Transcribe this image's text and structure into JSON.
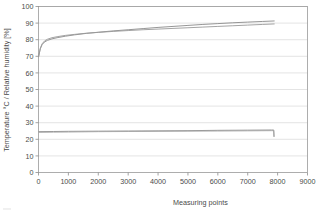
{
  "chart_data": {
    "type": "line",
    "title": "",
    "xlabel": "Measuring points",
    "ylabel": "Temperature °C / Relative humidity [%]",
    "xlim": [
      0,
      9000
    ],
    "ylim": [
      0,
      100
    ],
    "xticks": [
      0,
      1000,
      2000,
      3000,
      4000,
      5000,
      6000,
      7000,
      8000,
      9000
    ],
    "yticks": [
      0,
      10,
      20,
      30,
      40,
      50,
      60,
      70,
      80,
      90,
      100
    ],
    "xtick_labels": [
      "0",
      "1000",
      "2000",
      "3000",
      "4000",
      "5000",
      "6000",
      "7000",
      "8000",
      "9000"
    ],
    "ytick_labels": [
      "0",
      "10",
      "20",
      "30",
      "40",
      "50",
      "60",
      "70",
      "80",
      "90",
      "100"
    ],
    "grid": true,
    "grid_axis": "y",
    "legend": "none",
    "series": [
      {
        "name": "Relative humidity sensor 1",
        "unit": "%",
        "color": "#8a8a8a",
        "x": [
          0,
          60,
          120,
          200,
          300,
          450,
          650,
          900,
          1200,
          1600,
          2000,
          2500,
          3000,
          3500,
          4000,
          4500,
          5000,
          5500,
          6000,
          6500,
          7000,
          7500,
          7900
        ],
        "values": [
          69.5,
          74.5,
          77.0,
          78.6,
          79.6,
          80.5,
          81.3,
          82.1,
          82.9,
          83.8,
          84.5,
          85.3,
          86.0,
          86.7,
          87.4,
          88.0,
          88.6,
          89.2,
          89.7,
          90.2,
          90.6,
          91.0,
          91.3
        ]
      },
      {
        "name": "Relative humidity sensor 2",
        "unit": "%",
        "color": "#9a9a9a",
        "x": [
          0,
          60,
          120,
          200,
          300,
          450,
          650,
          900,
          1200,
          1600,
          2000,
          2500,
          3000,
          3500,
          4000,
          4500,
          5000,
          5500,
          6000,
          6500,
          7000,
          7500,
          7900
        ],
        "values": [
          69.5,
          74.8,
          77.5,
          79.2,
          80.3,
          81.2,
          81.9,
          82.6,
          83.2,
          83.9,
          84.4,
          85.0,
          85.5,
          86.0,
          86.4,
          86.8,
          87.2,
          87.6,
          88.0,
          88.4,
          88.8,
          89.2,
          89.5
        ]
      },
      {
        "name": "Temperature sensor 1",
        "unit": "°C",
        "color": "#8a8a8a",
        "x": [
          0,
          500,
          1000,
          2000,
          3000,
          4000,
          5000,
          6000,
          7000,
          7800,
          7870,
          7880
        ],
        "values": [
          24.6,
          24.7,
          24.8,
          24.9,
          25.0,
          25.1,
          25.2,
          25.4,
          25.5,
          25.6,
          25.6,
          21.5
        ]
      },
      {
        "name": "Temperature sensor 2",
        "unit": "°C",
        "color": "#a5a5a5",
        "x": [
          0,
          500,
          1000,
          2000,
          3000,
          4000,
          5000,
          6000,
          7000,
          7800,
          7870,
          7880
        ],
        "values": [
          24.2,
          24.3,
          24.4,
          24.6,
          24.7,
          24.8,
          24.9,
          25.0,
          25.1,
          25.2,
          25.2,
          21.5
        ]
      }
    ],
    "colors": {
      "axis": "#8c8c8c",
      "grid": "#d8d8d8",
      "text": "#4a4a4a",
      "background": "#ffffff"
    }
  }
}
